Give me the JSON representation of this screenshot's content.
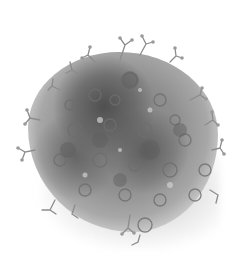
{
  "image": {
    "subject": "grayscale molecular cluster rendering",
    "background_color": "#ffffff",
    "palette": {
      "dark": "#5a5a5a",
      "mid": "#8a8a8a",
      "light": "#c4c4c4",
      "shadow": "#b8b8b8"
    }
  }
}
